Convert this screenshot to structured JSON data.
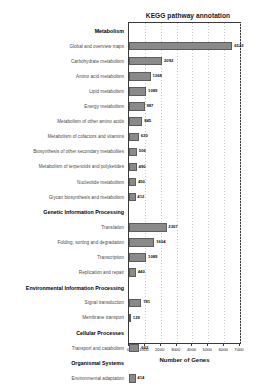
{
  "chart_data": {
    "type": "bar",
    "orientation": "horizontal",
    "title": "KEGG pathway annotation",
    "xlabel": "Number of Genes",
    "ylabel": "",
    "xlim": [
      0,
      7000
    ],
    "xticks": [
      0,
      1000,
      2000,
      3000,
      4000,
      5000,
      6000,
      7000
    ],
    "xticklabels": [
      "0",
      "1000",
      "2000",
      "3000",
      "4000",
      "5000",
      "6000",
      "7000"
    ],
    "grid": true,
    "legend": null,
    "bar_color": "#8a8a8a",
    "bar_edge_color": "#5d5d5d",
    "groups": [
      {
        "name": "Metabolism",
        "categories": [
          "Global and overview maps",
          "Carbohydrate metabolism",
          "Amino acid metabolism",
          "Lipid metabolism",
          "Energy metabolism",
          "Metabolism of other amino acids",
          "Metabolism of cofactors and vitamins",
          "Biosynthesis of other secondary metabolites",
          "Metabolism of terpenoids and polyketides",
          "Nucleotide metabolism",
          "Glycan biosynthesis and metabolism"
        ],
        "values": [
          6522,
          2092,
          1368,
          1089,
          987,
          845,
          630,
          506,
          490,
          450,
          412
        ]
      },
      {
        "name": "Genetic Information Processing",
        "categories": [
          "Translation",
          "Folding, sorting and degradation",
          "Transcription",
          "Replication and repair"
        ],
        "values": [
          2367,
          1604,
          1089,
          440
        ]
      },
      {
        "name": "Environmental Information Processing",
        "categories": [
          "Signal transduction",
          "Membrane transport"
        ],
        "values": [
          781,
          129
        ]
      },
      {
        "name": "Cellular Processes",
        "categories": [
          "Transport and catabolism"
        ],
        "values": [
          662
        ]
      },
      {
        "name": "Organismal Systems",
        "categories": [
          "Environmental adaptation"
        ],
        "values": [
          414
        ]
      }
    ]
  }
}
